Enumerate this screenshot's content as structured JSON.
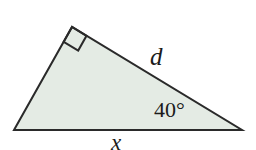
{
  "figure": {
    "type": "geometry-diagram",
    "shape": "right-triangle",
    "background_color": "#ffffff",
    "fill_color": "#e4ebe4",
    "stroke_color": "#2a2a2a",
    "stroke_width": 2,
    "width": 256,
    "height": 150,
    "vertices": {
      "left": {
        "name": "left-vertex",
        "x": 14,
        "y": 130
      },
      "apex": {
        "name": "apex-vertex-right-angle",
        "x": 72,
        "y": 27
      },
      "right": {
        "name": "right-vertex",
        "x": 242,
        "y": 130
      }
    },
    "right_angle_marker": {
      "at_vertex": "apex",
      "size": 17,
      "visible": true
    },
    "labels": {
      "hypotenuse": {
        "text": "d",
        "style": "italic",
        "side": "apex-to-right-vertex"
      },
      "angle": {
        "text": "40°",
        "style": "upright",
        "at_vertex": "right"
      },
      "base": {
        "text": "x",
        "style": "italic",
        "side": "left-vertex-to-right-vertex"
      }
    }
  },
  "geometry_values": {
    "angle_at_right_vertex_degrees": 40,
    "angle_at_apex_degrees": 90,
    "angle_at_left_vertex_degrees": 50,
    "side_d_label": "d",
    "side_x_label": "x"
  }
}
